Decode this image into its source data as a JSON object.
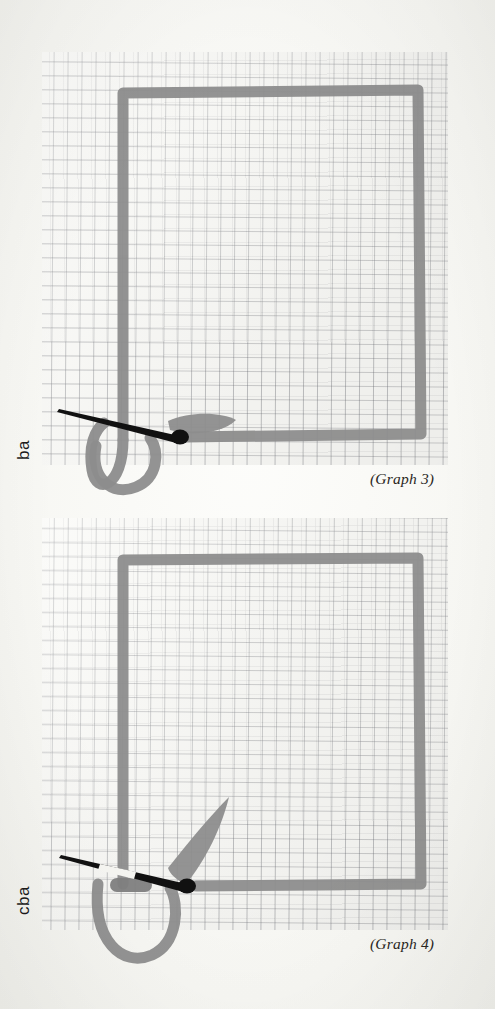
{
  "page": {
    "background_color": "#fbfbf8",
    "paper_color": "#fafaf7",
    "grid_line_color": "#6e7076",
    "path_color": "#8d8d8d",
    "needle_color": "#111111",
    "text_color": "#2a2724"
  },
  "graphs": [
    {
      "id": "graph-3",
      "caption": "(Graph 3)",
      "label": "ba",
      "label_rotation_deg": -90,
      "shape": {
        "type": "square-loop-with-hook",
        "stroke_color": "#8d8d8d",
        "stroke_width": 11,
        "square": {
          "left": 78,
          "top": 87,
          "right": 421,
          "bottom": 435
        },
        "hook": {
          "direction": "down-left-U",
          "cx": 120,
          "cy": 455
        },
        "blade": {
          "orientation": "horizontal",
          "x": 170,
          "y": 420
        }
      },
      "needle": {
        "color": "#111111",
        "tip_x": 60,
        "tip_y": 409,
        "base_x": 182,
        "base_y": 438,
        "has_white_gap": false
      },
      "grid": {
        "left": 42,
        "top": 52,
        "width": 406,
        "height": 413
      }
    },
    {
      "id": "graph-4",
      "caption": "(Graph 4)",
      "label": "cba",
      "label_rotation_deg": -90,
      "shape": {
        "type": "square-loop-with-hook",
        "stroke_color": "#8d8d8d",
        "stroke_width": 11,
        "square": {
          "left": 78,
          "top": 555,
          "right": 421,
          "bottom": 872
        },
        "hook": {
          "direction": "down-left-U",
          "cx": 120,
          "cy": 900
        },
        "blade": {
          "orientation": "diagonal-up-right",
          "x": 200,
          "y": 830
        },
        "pill": {
          "x": 110,
          "y": 884,
          "w": 40,
          "h": 13
        }
      },
      "needle": {
        "color": "#111111",
        "tip_x": 62,
        "tip_y": 855,
        "base_x": 190,
        "base_y": 888,
        "has_white_gap": true
      },
      "grid": {
        "left": 42,
        "top": 518,
        "width": 406,
        "height": 412
      }
    }
  ]
}
